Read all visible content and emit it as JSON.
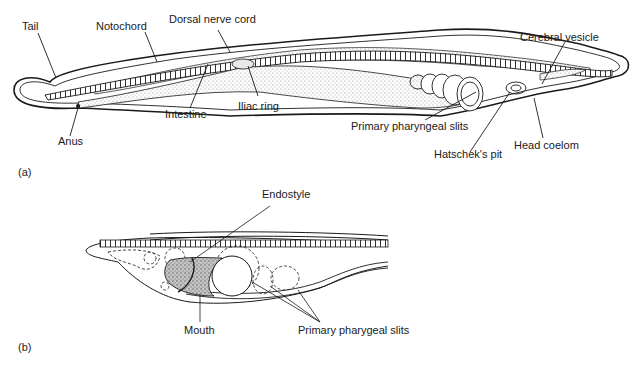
{
  "figure_a": {
    "panel_label": "(a)",
    "labels": {
      "tail": "Tail",
      "notochord": "Notochord",
      "dorsal_nerve_cord": "Dorsal nerve cord",
      "cerebral_vesicle": "Cerebral vesicle",
      "anus": "Anus",
      "intestine": "Intestine",
      "iliac_ring": "Iliac ring",
      "primary_pharyngeal_slits": "Primary pharyngeal slits",
      "hatscheks_pit": "Hatschek's pit",
      "head_coelom": "Head coelom"
    }
  },
  "figure_b": {
    "panel_label": "(b)",
    "labels": {
      "endostyle": "Endostyle",
      "mouth": "Mouth",
      "primary_pharygeal_slits": "Primary pharygeal slits"
    }
  },
  "colors": {
    "line": "#1a1a1a",
    "stipple": "#9a9a9a",
    "mouth_fill": "#b5b5b5"
  }
}
